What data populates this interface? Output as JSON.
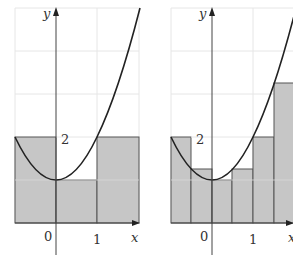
{
  "figure": {
    "function": "y = x^2 + 1",
    "colors": {
      "fill": "#c4c4c4",
      "stroke": "#555555",
      "grid": "#e4e4e4",
      "curve": "#222222",
      "axis": "#444444"
    },
    "left_panel": {
      "y_axis_label": "y",
      "x_axis_label": "x",
      "tick_label_2": "2",
      "tick_label_0": "0",
      "tick_label_1": "1",
      "rectangles": [
        {
          "x0": -1,
          "x1": 0,
          "height": 2
        },
        {
          "x0": 0,
          "x1": 1,
          "height": 1
        },
        {
          "x0": 1,
          "x1": 2,
          "height": 2
        }
      ]
    },
    "right_panel": {
      "y_axis_label": "y",
      "x_axis_label": "x",
      "tick_label_2": "2",
      "tick_label_0": "0",
      "tick_label_1": "1",
      "rectangles": [
        {
          "x0": -1,
          "x1": -0.5,
          "height": 2
        },
        {
          "x0": -0.5,
          "x1": 0,
          "height": 1.25
        },
        {
          "x0": 0,
          "x1": 0.5,
          "height": 1
        },
        {
          "x0": 0.5,
          "x1": 1,
          "height": 1.25
        },
        {
          "x0": 1,
          "x1": 1.5,
          "height": 2
        },
        {
          "x0": 1.5,
          "x1": 2,
          "height": 3.25
        }
      ]
    }
  }
}
